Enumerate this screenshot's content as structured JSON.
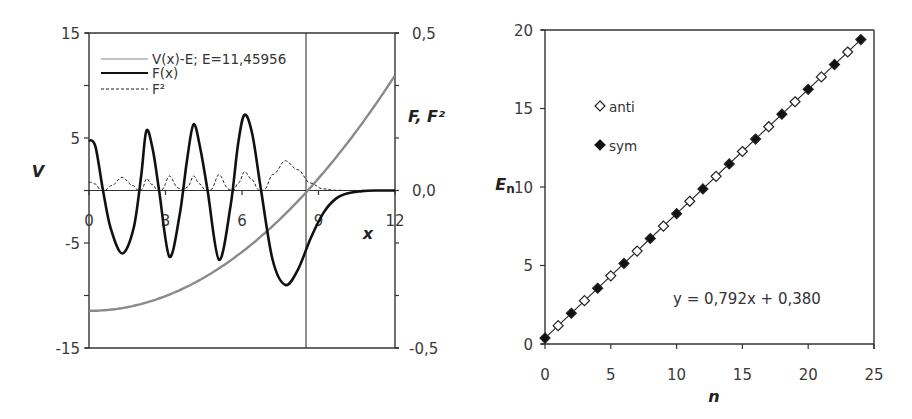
{
  "chart_data": [
    {
      "type": "line",
      "title": "",
      "xlabel": "x",
      "ylabel": "V",
      "y2label": "F, F²",
      "xlim": [
        0,
        12
      ],
      "ylim": [
        -15,
        15
      ],
      "y2lim": [
        -0.5,
        0.5
      ],
      "x_ticks": [
        "0",
        "3",
        "6",
        "9",
        "12"
      ],
      "y_ticks": [
        "15",
        "5",
        "-5",
        "-15"
      ],
      "y_minor_ticks": [
        15,
        10,
        5,
        0,
        -5,
        -10,
        -15
      ],
      "y2_ticks": [
        "0,5",
        "0,0",
        "-0,5"
      ],
      "grid": false,
      "turning_point_x": 8.56,
      "legend": {
        "position": "upper-left-inside",
        "entries": [
          "V(x)-E; E=11,45956",
          "F(x)",
          "F²"
        ]
      },
      "series": [
        {
          "name": "V(x)-E; E=11,45956",
          "axis": "left",
          "style": "solid-gray",
          "formula": "0.1557*x^2 - 11.46",
          "x": [
            0,
            1,
            2,
            3,
            4,
            5,
            6,
            7,
            8,
            9,
            10,
            11,
            12
          ],
          "values": [
            -11.46,
            -11.3,
            -10.84,
            -10.06,
            -8.97,
            -7.57,
            -5.86,
            -3.83,
            -1.5,
            1.15,
            4.11,
            7.38,
            10.96
          ]
        },
        {
          "name": "F(x)",
          "axis": "right",
          "style": "solid-black-thick",
          "x": [
            0,
            0.25,
            0.55,
            0.85,
            1.3,
            1.75,
            2.05,
            2.25,
            2.5,
            2.75,
            3.15,
            3.55,
            3.85,
            4.1,
            4.35,
            4.65,
            5.1,
            5.55,
            5.85,
            6.1,
            6.4,
            6.75,
            7.2,
            7.7,
            8.2,
            8.7,
            9.2,
            9.7,
            10.2,
            10.7,
            11.2,
            12
          ],
          "values": [
            0.16,
            0.14,
            0.0,
            -0.12,
            -0.2,
            -0.12,
            0.05,
            0.19,
            0.13,
            0.0,
            -0.21,
            -0.08,
            0.1,
            0.21,
            0.14,
            0.0,
            -0.22,
            -0.05,
            0.15,
            0.24,
            0.18,
            0.0,
            -0.22,
            -0.3,
            -0.25,
            -0.15,
            -0.07,
            -0.025,
            -0.008,
            -0.002,
            0.0,
            0.0
          ]
        },
        {
          "name": "F²",
          "axis": "right",
          "style": "dashed-black",
          "derived": "square of F(x)"
        }
      ]
    },
    {
      "type": "scatter",
      "title": "",
      "xlabel": "n",
      "ylabel": "E_n",
      "ylabel_main": "E",
      "ylabel_sub": "n",
      "xlim": [
        0,
        25
      ],
      "ylim": [
        0,
        20
      ],
      "x_ticks": [
        "0",
        "5",
        "10",
        "15",
        "20",
        "25"
      ],
      "y_ticks": [
        "0",
        "5",
        "10",
        "15",
        "20"
      ],
      "grid": false,
      "legend": {
        "position": "upper-left-inside",
        "entries": [
          "anti",
          "sym"
        ]
      },
      "trendline": {
        "label": "y = 0,792x + 0,380",
        "slope": 0.792,
        "intercept": 0.38
      },
      "series": [
        {
          "name": "anti",
          "marker": "open-diamond",
          "x": [
            1,
            3,
            5,
            7,
            9,
            11,
            13,
            15,
            17,
            19,
            21,
            23
          ],
          "values": [
            1.17,
            2.76,
            4.34,
            5.92,
            7.51,
            9.09,
            10.68,
            12.26,
            13.84,
            15.43,
            17.01,
            18.6
          ]
        },
        {
          "name": "sym",
          "marker": "filled-diamond",
          "x": [
            0,
            2,
            4,
            6,
            8,
            10,
            12,
            14,
            16,
            18,
            20,
            22,
            24
          ],
          "values": [
            0.38,
            1.96,
            3.55,
            5.13,
            6.72,
            8.3,
            9.88,
            11.47,
            13.05,
            14.64,
            16.22,
            17.8,
            19.39
          ]
        }
      ]
    }
  ],
  "labels": {
    "left": {
      "ylabel": "V",
      "y2label": "F, F²",
      "xlabel": "x",
      "legend": [
        "V(x)-E; E=11,45956",
        "F(x)",
        "F²"
      ]
    },
    "right": {
      "ylabel_main": "E",
      "ylabel_sub": "n",
      "xlabel": "n",
      "legend": [
        "anti",
        "sym"
      ],
      "equation": "y = 0,792x + 0,380"
    }
  },
  "colors": {
    "axis": "#333333",
    "potential": "#8a8a8a",
    "wavefunction": "#111111",
    "density": "#222222",
    "marker_fill": "#111111",
    "marker_open": "#ffffff"
  }
}
